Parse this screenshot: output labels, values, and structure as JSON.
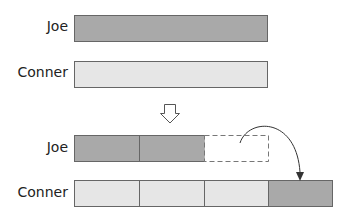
{
  "before": {
    "joe": {
      "label": "Joe",
      "color": "#a9a9a9"
    },
    "conner": {
      "label": "Conner",
      "color": "#e6e6e6"
    }
  },
  "after": {
    "joe": {
      "label": "Joe",
      "segments": [
        "filled",
        "filled",
        "empty-dashed"
      ]
    },
    "conner": {
      "label": "Conner",
      "segments": [
        "light",
        "light",
        "light",
        "transferred"
      ]
    }
  },
  "colors": {
    "dark": "#a9a9a9",
    "light": "#e6e6e6",
    "border": "#666666"
  },
  "arrow_down": "hollow-down-arrow",
  "transfer_arrow": "curved-arrow"
}
